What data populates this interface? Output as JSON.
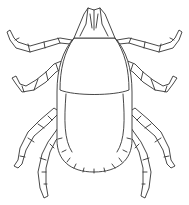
{
  "image": {
    "subject": "tick line drawing",
    "colors": {
      "background": "#ffffff",
      "stroke": "#333333"
    }
  }
}
